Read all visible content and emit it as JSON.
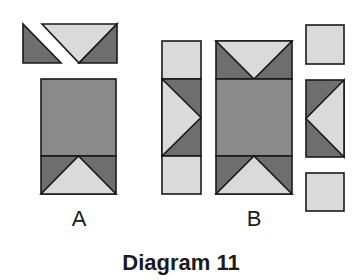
{
  "title": "Diagram 11",
  "labels": {
    "a": "A",
    "b": "B"
  },
  "colors": {
    "dark": "#6e6e6e",
    "medium": "#8a8a8a",
    "light": "#dadada",
    "stroke": "#1a1a1a",
    "background": "#ffffff"
  },
  "parts": {
    "a": {
      "top_row": [
        "dark-corner-triangle",
        "light-goose-triangle-pointing-down",
        "dark-corner-triangle"
      ],
      "body": [
        "dark-rectangle",
        "flying-geese-unit-pointing-up"
      ]
    },
    "b": {
      "left_column": [
        "light-square",
        "flying-geese-unit-pointing-right",
        "light-square"
      ],
      "center_column": [
        "flying-geese-unit-pointing-down",
        "dark-rectangle",
        "flying-geese-unit-pointing-up"
      ],
      "right_column": [
        "light-square",
        "flying-geese-unit-pointing-left",
        "light-square"
      ]
    }
  }
}
